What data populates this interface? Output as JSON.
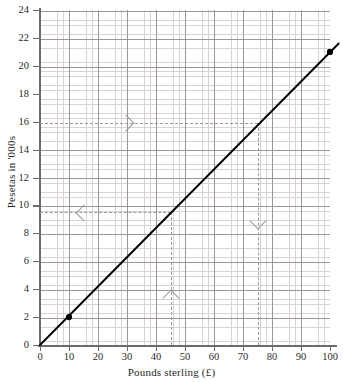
{
  "chart_data": {
    "type": "line",
    "title": "",
    "xlabel": "Pounds sterling (£)",
    "ylabel": "Pesetas in '000s",
    "xlim": [
      0,
      103
    ],
    "ylim": [
      0,
      24
    ],
    "grid": true,
    "legend": null,
    "x_ticks": [
      "0",
      "10",
      "20",
      "30",
      "40",
      "50",
      "60",
      "70",
      "80",
      "90",
      "100"
    ],
    "x_tick_values": [
      0,
      10,
      20,
      30,
      40,
      50,
      60,
      70,
      80,
      90,
      100
    ],
    "y_ticks": [
      "0",
      "2",
      "4",
      "6",
      "8",
      "10",
      "12",
      "14",
      "16",
      "18",
      "20",
      "22",
      "24"
    ],
    "y_tick_values": [
      0,
      2,
      4,
      6,
      8,
      10,
      12,
      14,
      16,
      18,
      20,
      22,
      24
    ],
    "series": [
      {
        "name": "conversion-line",
        "type": "line",
        "color": "#000000",
        "x": [
          0,
          103
        ],
        "values": [
          0,
          21.6
        ]
      }
    ],
    "markers": [
      {
        "name": "marker-low",
        "x": 10,
        "y": 2.0,
        "label": ""
      },
      {
        "name": "marker-high",
        "x": 100,
        "y": 21.0,
        "label": ""
      }
    ],
    "annotations": [
      {
        "name": "read-up-from-45-pounds",
        "kind": "guide",
        "direction": "up-then-left",
        "from_x": 45,
        "to_y": 9.5,
        "arrows": [
          "up",
          "left"
        ]
      },
      {
        "name": "read-across-from-16000-pesetas",
        "kind": "guide",
        "direction": "right-then-down",
        "from_y": 16,
        "to_x": 75,
        "arrows": [
          "right",
          "down"
        ]
      }
    ]
  },
  "colors": {
    "line": "#000000",
    "marker": "#000000",
    "guide": "#9a9a9a",
    "grid_major": "#9b9797",
    "grid_minor": "#d9d3d3",
    "axis": "#6e6a6a",
    "text": "#1f1f1f",
    "background": "#ffffff"
  }
}
